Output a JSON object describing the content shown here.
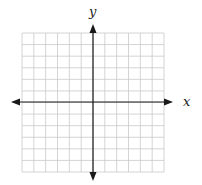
{
  "diagram": {
    "type": "coordinate-plane",
    "grid": {
      "columns": 12,
      "rows": 12,
      "left": 22,
      "top": 33,
      "right": 164,
      "bottom": 172,
      "line_color": "#c9c9c9"
    },
    "axes": {
      "origin_x": 93,
      "origin_y": 102,
      "color": "#1a1a1a",
      "x_label": "x",
      "y_label": "y",
      "x_arrow_left": 11,
      "x_arrow_right": 173,
      "y_arrow_top": 24,
      "y_arrow_bottom": 181
    }
  }
}
